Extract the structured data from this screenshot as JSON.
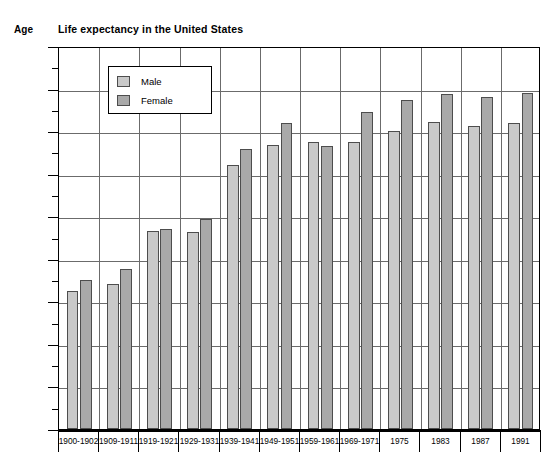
{
  "chart_data": {
    "type": "bar",
    "title": "Life expectancy in the United States",
    "xlabel": "",
    "ylabel": "Age",
    "ylim": [
      0,
      90
    ],
    "ytick_step": 10,
    "yticks": [
      0,
      10,
      20,
      30,
      40,
      50,
      60,
      70,
      80,
      90
    ],
    "minor_tick_step": 5,
    "grid": true,
    "legend_position": "inside-top-left",
    "categories": [
      "1900-1902",
      "1909-1911",
      "1919-1921",
      "1929-1931",
      "1939-1941",
      "1949-1951",
      "1959-1961",
      "1969-1971",
      "1975",
      "1983",
      "1987",
      "1991"
    ],
    "series": [
      {
        "name": "Male",
        "color": "#c9c9c9",
        "values": [
          32.5,
          34.0,
          46.5,
          46.3,
          62.0,
          66.8,
          67.5,
          67.5,
          70.0,
          72.2,
          71.2,
          72.0
        ]
      },
      {
        "name": "Female",
        "color": "#a9a9a9",
        "values": [
          35.0,
          37.5,
          47.0,
          49.3,
          65.8,
          71.8,
          66.5,
          74.5,
          77.2,
          78.7,
          78.0,
          79.0
        ]
      }
    ]
  },
  "legend": {
    "items": [
      {
        "label": "Male"
      },
      {
        "label": "Female"
      }
    ]
  }
}
